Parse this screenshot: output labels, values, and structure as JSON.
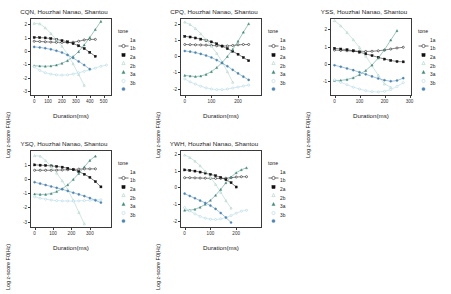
{
  "figure": {
    "background": "#ffffff",
    "panel_titles_suffix": "Houzhai Nanao, Shantou",
    "legend_title": "tone",
    "xlabel": "Duration(ms)",
    "ylabel": "Log z-score F0(Hz)"
  },
  "legend": {
    "title": "tone",
    "entries": [
      {
        "label": "1a",
        "shape": "open-circle-line",
        "color": "#111111"
      },
      {
        "label": "1b",
        "shape": "filled-square",
        "color": "#111111"
      },
      {
        "label": "2a",
        "shape": "open-triangle",
        "color": "#9ecfc4"
      },
      {
        "label": "2b",
        "shape": "filled-triangle",
        "color": "#3f8c7c"
      },
      {
        "label": "3a",
        "shape": "open-circle",
        "color": "#a8d4e6"
      },
      {
        "label": "3b",
        "shape": "filled-circle",
        "color": "#4a86b8"
      }
    ]
  },
  "chart_data": [
    {
      "type": "line",
      "title": "CQN, Houzhai Nanao, Shantou",
      "xlabel": "Duration(ms)",
      "ylabel": "Log z-score F0(Hz)",
      "xlim": [
        -30,
        560
      ],
      "ylim": [
        -3.35,
        2.45
      ],
      "xticks": [
        0,
        100,
        200,
        300,
        400,
        500
      ],
      "yticks": [
        2,
        1,
        0,
        -1,
        -2,
        -3
      ],
      "grid": false,
      "legend_position": "right",
      "series": [
        {
          "name": "1a",
          "x": [
            0,
            40,
            80,
            120,
            160,
            200,
            240,
            280,
            320,
            360,
            400,
            440
          ],
          "values": [
            0.72,
            0.7,
            0.68,
            0.66,
            0.64,
            0.63,
            0.62,
            0.65,
            0.72,
            0.82,
            0.86,
            0.86
          ]
        },
        {
          "name": "1b",
          "x": [
            0,
            40,
            80,
            120,
            160,
            200,
            240,
            280,
            320,
            360,
            400,
            440
          ],
          "values": [
            1.0,
            0.99,
            0.97,
            0.92,
            0.86,
            0.77,
            0.68,
            0.55,
            0.38,
            0.18,
            -0.1,
            -0.4
          ]
        },
        {
          "name": "2a",
          "x": [
            0,
            40,
            80,
            120,
            160,
            200,
            240,
            280,
            320,
            360
          ],
          "values": [
            2.05,
            2.02,
            1.72,
            1.3,
            0.85,
            0.35,
            -0.25,
            -0.95,
            -1.75,
            -2.55
          ]
        },
        {
          "name": "2b",
          "x": [
            0,
            40,
            80,
            120,
            160,
            200,
            240,
            280,
            320,
            360,
            400,
            440,
            480
          ],
          "values": [
            -1.1,
            -1.12,
            -1.14,
            -1.12,
            -1.05,
            -0.92,
            -0.72,
            -0.42,
            -0.05,
            0.45,
            1.0,
            1.6,
            2.2
          ]
        },
        {
          "name": "3a",
          "x": [
            0,
            40,
            80,
            120,
            160,
            200,
            240,
            280,
            320,
            360,
            400,
            440,
            480,
            520
          ],
          "values": [
            -1.18,
            -1.45,
            -1.62,
            -1.72,
            -1.78,
            -1.8,
            -1.78,
            -1.72,
            -1.62,
            -1.52,
            -1.4,
            -1.28,
            -1.14,
            -1.05
          ]
        },
        {
          "name": "3b",
          "x": [
            0,
            40,
            80,
            120,
            160,
            200,
            240,
            280,
            320,
            360,
            400
          ],
          "values": [
            0.3,
            0.26,
            0.2,
            0.12,
            0.02,
            -0.12,
            -0.3,
            -0.52,
            -0.78,
            -1.05,
            -1.35
          ]
        }
      ]
    },
    {
      "type": "line",
      "title": "CPQ, Houzhai Nanao, Shantou",
      "xlabel": "Duration(ms)",
      "ylabel": "Log z-score F0(Hz)",
      "xlim": [
        -18,
        290
      ],
      "ylim": [
        -2.45,
        2.35
      ],
      "xticks": [
        0,
        100,
        200
      ],
      "yticks": [
        2,
        1,
        0,
        -1,
        -2
      ],
      "grid": false,
      "legend_position": "right",
      "series": [
        {
          "name": "1a",
          "x": [
            0,
            20,
            40,
            60,
            80,
            100,
            120,
            140,
            160,
            180,
            200,
            220,
            240
          ],
          "values": [
            0.72,
            0.71,
            0.7,
            0.69,
            0.68,
            0.66,
            0.64,
            0.63,
            0.63,
            0.66,
            0.7,
            0.72,
            0.72
          ]
        },
        {
          "name": "1b",
          "x": [
            0,
            20,
            40,
            60,
            80,
            100,
            120,
            140,
            160,
            180,
            200,
            220,
            240
          ],
          "values": [
            1.22,
            1.18,
            1.12,
            1.05,
            0.98,
            0.88,
            0.76,
            0.62,
            0.46,
            0.3,
            0.12,
            -0.08,
            -0.28
          ]
        },
        {
          "name": "2a",
          "x": [
            0,
            20,
            40,
            60,
            80,
            100,
            120,
            140,
            160,
            180
          ],
          "values": [
            2.1,
            1.95,
            1.7,
            1.38,
            1.02,
            0.62,
            0.18,
            -0.35,
            -0.95,
            -1.6
          ]
        },
        {
          "name": "2b",
          "x": [
            0,
            20,
            40,
            60,
            80,
            100,
            120,
            140,
            160,
            180,
            200,
            220,
            240
          ],
          "values": [
            -1.18,
            -1.22,
            -1.25,
            -1.22,
            -1.12,
            -0.95,
            -0.7,
            -0.4,
            -0.02,
            0.42,
            0.92,
            1.48,
            2.0
          ]
        },
        {
          "name": "3a",
          "x": [
            0,
            20,
            40,
            60,
            80,
            100,
            120,
            140,
            160,
            180,
            200,
            220,
            240
          ],
          "values": [
            -1.4,
            -1.58,
            -1.72,
            -1.85,
            -1.95,
            -2.02,
            -2.06,
            -2.06,
            -2.02,
            -1.96,
            -1.9,
            -1.84,
            -1.78
          ]
        },
        {
          "name": "3b",
          "x": [
            0,
            20,
            40,
            60,
            80,
            100,
            120,
            140,
            160,
            180,
            200,
            220,
            240
          ],
          "values": [
            0.32,
            0.28,
            0.22,
            0.14,
            0.04,
            -0.08,
            -0.24,
            -0.42,
            -0.62,
            -0.84,
            -1.06,
            -1.26,
            -1.46
          ]
        }
      ]
    },
    {
      "type": "line",
      "title": "YSS, Houzhai Nanao, Shantou",
      "xlabel": "Duration(ms)",
      "ylabel": "Log z-score F0(Hz)",
      "xlim": [
        -18,
        310
      ],
      "ylim": [
        -1.85,
        2.65
      ],
      "xticks": [
        0,
        100,
        200,
        300
      ],
      "yticks": [
        2,
        1,
        0,
        -1
      ],
      "grid": false,
      "legend_position": "right",
      "series": [
        {
          "name": "1a",
          "x": [
            0,
            25,
            50,
            75,
            100,
            125,
            150,
            175,
            200,
            225,
            250,
            275
          ],
          "values": [
            0.8,
            0.78,
            0.76,
            0.74,
            0.73,
            0.72,
            0.73,
            0.76,
            0.8,
            0.86,
            0.92,
            0.96
          ]
        },
        {
          "name": "1b",
          "x": [
            0,
            25,
            50,
            75,
            100,
            125,
            150,
            175,
            200,
            225,
            250,
            275
          ],
          "values": [
            0.9,
            0.86,
            0.82,
            0.76,
            0.68,
            0.58,
            0.48,
            0.38,
            0.28,
            0.2,
            0.14,
            0.12
          ]
        },
        {
          "name": "2a",
          "x": [
            0,
            25,
            50,
            75,
            100,
            125,
            150,
            175,
            200,
            225
          ],
          "values": [
            2.5,
            2.2,
            1.82,
            1.4,
            0.95,
            0.45,
            -0.1,
            -0.65,
            -1.15,
            -1.35
          ]
        },
        {
          "name": "2b",
          "x": [
            0,
            25,
            50,
            75,
            100,
            125,
            150,
            175,
            200,
            225,
            250
          ],
          "values": [
            -0.95,
            -0.95,
            -0.9,
            -0.8,
            -0.62,
            -0.38,
            -0.06,
            0.34,
            0.82,
            1.38,
            1.92
          ]
        },
        {
          "name": "3a",
          "x": [
            0,
            25,
            50,
            75,
            100,
            125,
            150,
            175,
            200,
            225,
            250,
            275
          ],
          "values": [
            -0.92,
            -1.06,
            -1.2,
            -1.34,
            -1.45,
            -1.54,
            -1.6,
            -1.62,
            -1.58,
            -1.48,
            -1.3,
            -1.08
          ]
        },
        {
          "name": "3b",
          "x": [
            0,
            25,
            50,
            75,
            100,
            125,
            150,
            175,
            200,
            225,
            250,
            275
          ],
          "values": [
            -0.08,
            -0.16,
            -0.26,
            -0.36,
            -0.48,
            -0.6,
            -0.72,
            -0.84,
            -0.94,
            -1.0,
            -0.96,
            -0.82
          ]
        }
      ]
    },
    {
      "type": "line",
      "title": "YSQ, Houzhai Nanao, Shantou",
      "xlabel": "Duration(ms)",
      "ylabel": "Log z-score F0(Hz)",
      "xlim": [
        -25,
        420
      ],
      "ylim": [
        -3.45,
        2.05
      ],
      "xticks": [
        0,
        100,
        200,
        300
      ],
      "yticks": [
        1,
        0,
        -1,
        -2,
        -3
      ],
      "grid": false,
      "legend_position": "right",
      "series": [
        {
          "name": "1a",
          "x": [
            0,
            30,
            60,
            90,
            120,
            150,
            180,
            210,
            240,
            270,
            300,
            330
          ],
          "values": [
            0.62,
            0.62,
            0.62,
            0.62,
            0.63,
            0.64,
            0.66,
            0.68,
            0.7,
            0.72,
            0.72,
            0.72
          ]
        },
        {
          "name": "1b",
          "x": [
            0,
            30,
            60,
            90,
            120,
            150,
            180,
            210,
            240,
            270,
            300,
            330,
            360
          ],
          "values": [
            1.0,
            0.98,
            0.96,
            0.93,
            0.89,
            0.84,
            0.76,
            0.66,
            0.52,
            0.34,
            0.12,
            -0.18,
            -0.55
          ]
        },
        {
          "name": "2a",
          "x": [
            0,
            30,
            60,
            90,
            120,
            150,
            180,
            210,
            240,
            270
          ],
          "values": [
            1.65,
            1.62,
            1.3,
            0.88,
            0.42,
            -0.12,
            -0.75,
            -1.5,
            -2.35,
            -3.15
          ]
        },
        {
          "name": "2b",
          "x": [
            0,
            30,
            60,
            90,
            120,
            150,
            180,
            210,
            240,
            270,
            300,
            330
          ],
          "values": [
            -1.05,
            -1.08,
            -1.08,
            -1.02,
            -0.88,
            -0.68,
            -0.4,
            -0.02,
            0.4,
            0.86,
            1.32,
            1.62
          ]
        },
        {
          "name": "3a",
          "x": [
            0,
            30,
            60,
            90,
            120,
            150,
            180,
            210,
            240,
            270,
            300,
            330,
            360
          ],
          "values": [
            -1.25,
            -1.35,
            -1.42,
            -1.48,
            -1.52,
            -1.54,
            -1.55,
            -1.55,
            -1.54,
            -1.52,
            -1.5,
            -1.48,
            -1.46
          ]
        },
        {
          "name": "3b",
          "x": [
            0,
            30,
            60,
            90,
            120,
            150,
            180,
            210,
            240,
            270,
            300,
            330,
            360
          ],
          "values": [
            -0.22,
            -0.32,
            -0.42,
            -0.52,
            -0.62,
            -0.72,
            -0.84,
            -0.96,
            -1.08,
            -1.2,
            -1.34,
            -1.5,
            -1.66
          ]
        }
      ]
    },
    {
      "type": "line",
      "title": "YWH, Houzhai Nanao, Shantou",
      "xlabel": "Duration(ms)",
      "ylabel": "Log z-score F0(Hz)",
      "xlim": [
        -18,
        300
      ],
      "ylim": [
        -2.45,
        2.25
      ],
      "xticks": [
        0,
        100,
        200
      ],
      "yticks": [
        2,
        1,
        0,
        -1,
        -2
      ],
      "grid": false,
      "legend_position": "right",
      "series": [
        {
          "name": "1a",
          "x": [
            0,
            20,
            40,
            60,
            80,
            100,
            120,
            140,
            160,
            180,
            200,
            220,
            240
          ],
          "values": [
            0.58,
            0.58,
            0.57,
            0.56,
            0.55,
            0.54,
            0.54,
            0.54,
            0.55,
            0.58,
            0.62,
            0.64,
            0.64
          ]
        },
        {
          "name": "1b",
          "x": [
            0,
            20,
            40,
            60,
            80,
            100,
            120,
            140,
            160,
            180,
            200
          ],
          "values": [
            1.05,
            1.02,
            0.98,
            0.92,
            0.86,
            0.78,
            0.7,
            0.6,
            0.46,
            0.28,
            0.02
          ]
        },
        {
          "name": "2a",
          "x": [
            0,
            20,
            40,
            60,
            80,
            100,
            120,
            140,
            160,
            180
          ],
          "values": [
            1.95,
            1.8,
            1.58,
            1.3,
            0.98,
            0.6,
            0.18,
            -0.3,
            -0.8,
            -1.25
          ]
        },
        {
          "name": "2b",
          "x": [
            0,
            20,
            40,
            60,
            80,
            100,
            120,
            140,
            160,
            180,
            200,
            220,
            240
          ],
          "values": [
            -1.38,
            -1.38,
            -1.32,
            -1.2,
            -1.02,
            -0.78,
            -0.48,
            -0.12,
            0.28,
            0.62,
            0.88,
            1.06,
            1.18
          ]
        },
        {
          "name": "3a",
          "x": [
            0,
            20,
            40,
            60,
            80,
            100,
            120,
            140,
            160,
            180,
            200,
            220,
            240
          ],
          "values": [
            -1.22,
            -1.42,
            -1.6,
            -1.75,
            -1.86,
            -1.92,
            -1.94,
            -1.9,
            -1.82,
            -1.7,
            -1.56,
            -1.44,
            -1.38
          ]
        },
        {
          "name": "3b",
          "x": [
            0,
            20,
            40,
            60,
            80,
            100,
            120,
            140,
            160,
            180
          ],
          "values": [
            -0.38,
            -0.52,
            -0.66,
            -0.8,
            -0.94,
            -1.1,
            -1.3,
            -1.55,
            -1.82,
            -2.12
          ]
        }
      ]
    }
  ]
}
